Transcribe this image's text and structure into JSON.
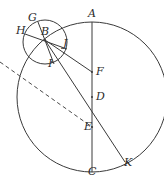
{
  "figure": {
    "type": "geometry-diagram",
    "title": "",
    "canvas": {
      "width": 164,
      "height": 180
    },
    "stroke_color": "#3a3a3a",
    "dashed_color": "#4a4a4a",
    "label_color": "#2b2b2b",
    "background": "#ffffff"
  },
  "points": {
    "A": {
      "label": "A",
      "x": 92,
      "y": 22,
      "label_x": 88,
      "label_y": 8
    },
    "B": {
      "label": "B",
      "x": 45,
      "y": 40,
      "label_x": 41,
      "label_y": 26
    },
    "C": {
      "label": "C",
      "x": 92,
      "y": 172,
      "label_x": 88,
      "label_y": 166
    },
    "D": {
      "label": "D",
      "x": 92,
      "y": 97,
      "label_x": 96,
      "label_y": 91
    },
    "E": {
      "label": "E",
      "x": 92,
      "y": 127,
      "label_x": 84,
      "label_y": 121
    },
    "F": {
      "label": "F",
      "x": 92,
      "y": 72,
      "label_x": 96,
      "label_y": 66
    },
    "G": {
      "label": "G",
      "x": 38,
      "y": 24,
      "label_x": 28,
      "label_y": 12
    },
    "H": {
      "label": "H",
      "x": 26,
      "y": 35,
      "label_x": 16,
      "label_y": 25
    },
    "I": {
      "label": "I",
      "x": 52,
      "y": 62,
      "label_x": 48,
      "label_y": 58
    },
    "J": {
      "label": "J",
      "x": 65,
      "y": 47,
      "label_x": 63,
      "label_y": 38
    },
    "K": {
      "label": "K",
      "x": 125,
      "y": 162,
      "label_x": 124,
      "label_y": 157
    }
  },
  "circles": [
    {
      "name": "large-circle",
      "cx": 92,
      "cy": 97,
      "r": 75
    },
    {
      "name": "small-circle",
      "cx": 45,
      "cy": 42,
      "r": 22
    }
  ],
  "segments": [
    {
      "name": "segment-AC",
      "from": "A",
      "to": "C"
    },
    {
      "name": "segment-BF",
      "from": "B",
      "to": "F"
    },
    {
      "name": "segment-BK",
      "from": "B",
      "to": "K"
    },
    {
      "name": "segment-HJ",
      "from": "H",
      "to": "J"
    },
    {
      "name": "segment-GI",
      "from": "G",
      "to": "I"
    }
  ],
  "dashed_segments": [
    {
      "name": "dashed-line-to-E",
      "x1": 0,
      "y1": 62,
      "x2": 92,
      "y2": 127
    }
  ],
  "labels_order": [
    "G",
    "H",
    "A",
    "B",
    "J",
    "I",
    "F",
    "D",
    "E",
    "C",
    "K"
  ]
}
